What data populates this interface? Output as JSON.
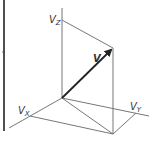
{
  "diagram": {
    "type": "3d-vector-decomposition",
    "colors": {
      "line": "#555555",
      "vector": "#222222",
      "border": "#222222",
      "background": "#ffffff"
    },
    "labels": {
      "vector": "V",
      "vz": "V",
      "vz_sub": "Z",
      "vx": "V",
      "vx_sub": "X",
      "vy": "V",
      "vy_sub": "Y"
    },
    "points": {
      "origin": [
        62,
        98
      ],
      "tip": [
        113,
        48
      ],
      "vz": [
        62,
        20
      ],
      "vx": [
        30,
        116
      ],
      "vy": [
        136,
        113
      ],
      "base": [
        113,
        134
      ]
    }
  }
}
